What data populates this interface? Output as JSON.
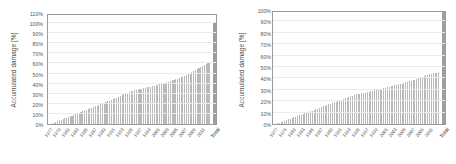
{
  "figure": {
    "background_color": "#ffffff",
    "bar_color": "#b9b9b9",
    "total_bar_color": "#9e9e9e",
    "grid_color": "#ececec",
    "frame_color": "#9a9a9a"
  },
  "charts": [
    {
      "id": "left-chart",
      "ylabel": "Accumulated damage [%]",
      "xlabel": "",
      "yticks": [
        "0%",
        "10%",
        "20%",
        "30%",
        "40%",
        "50%",
        "60%",
        "70%",
        "80%",
        "90%",
        "100%",
        "110%"
      ],
      "total_label": "Total",
      "xticks": [
        "1977",
        "1979",
        "1981",
        "1983",
        "1985",
        "1987",
        "1989",
        "1991",
        "1993",
        "1995",
        "1997",
        "1999",
        "2001",
        "2003",
        "2005",
        "2007",
        "2009",
        "2011"
      ]
    },
    {
      "id": "right-chart",
      "ylabel": "Accumulated damage [%]",
      "xlabel": "",
      "yticks": [
        "0%",
        "10%",
        "20%",
        "30%",
        "40%",
        "50%",
        "60%",
        "70%",
        "80%",
        "90%",
        "100%"
      ],
      "total_label": "Total",
      "xticks": [
        "1977",
        "1979",
        "1981",
        "1983",
        "1985",
        "1987",
        "1989",
        "1991",
        "1993",
        "1995",
        "1997",
        "1999",
        "2001",
        "2003",
        "2005",
        "2007",
        "2009",
        "2011"
      ]
    }
  ],
  "chart_data": [
    {
      "type": "bar",
      "id": "left-chart",
      "title": "",
      "xlabel": "",
      "ylabel": "Accumulated damage [%]",
      "ylim": [
        0,
        110
      ],
      "ytick_values": [
        0,
        10,
        20,
        30,
        40,
        50,
        60,
        70,
        80,
        90,
        100,
        110
      ],
      "ytick_labels": [
        "0%",
        "10%",
        "20%",
        "30%",
        "40%",
        "50%",
        "60%",
        "70%",
        "80%",
        "90%",
        "100%",
        "110%"
      ],
      "grid": true,
      "grid_axis": "y",
      "legend": false,
      "note": "Monotonically increasing cumulative (accumulated damage) bars per time bin, followed by a separated final 'Total' bar at 100%.",
      "categories": [
        "1977",
        "",
        "",
        "",
        "",
        "1979",
        "",
        "",
        "",
        "",
        "1981",
        "",
        "",
        "",
        "",
        "1983",
        "",
        "",
        "",
        "",
        "1985",
        "",
        "",
        "",
        "",
        "1987",
        "",
        "",
        "",
        "",
        "1989",
        "",
        "",
        "",
        "",
        "1991",
        "",
        "",
        "",
        "",
        "1993",
        "",
        "",
        "",
        "",
        "1995",
        "",
        "",
        "",
        "",
        "1997",
        "",
        "",
        "",
        "",
        "1999",
        "",
        "",
        "",
        "",
        "2001",
        "",
        "",
        "",
        "",
        "2003",
        "",
        "",
        "",
        "",
        "2005",
        "",
        "",
        "",
        "",
        "2007",
        "",
        "",
        "",
        "",
        "2009",
        "",
        "",
        "",
        "",
        "2011",
        "",
        "",
        "",
        "Total"
      ],
      "values": [
        0.4,
        0.9,
        1.5,
        2.1,
        2.8,
        3.5,
        4.2,
        4.9,
        5.6,
        6.3,
        7.0,
        7.7,
        8.4,
        9.1,
        9.8,
        10.5,
        11.2,
        11.9,
        12.6,
        13.3,
        14.0,
        14.7,
        15.4,
        16.1,
        16.8,
        17.5,
        18.2,
        18.9,
        19.6,
        20.3,
        21.0,
        21.7,
        22.4,
        23.1,
        23.8,
        24.5,
        25.3,
        26.1,
        26.9,
        27.7,
        28.6,
        29.5,
        30.4,
        31.2,
        31.9,
        32.5,
        33.0,
        33.4,
        33.8,
        34.2,
        34.6,
        35.0,
        35.4,
        35.8,
        36.2,
        36.6,
        37.0,
        37.5,
        38.0,
        38.5,
        39.0,
        39.5,
        40.0,
        40.5,
        41.0,
        41.5,
        42.0,
        42.6,
        43.2,
        43.8,
        44.4,
        45.0,
        45.6,
        46.2,
        46.8,
        47.5,
        48.5,
        49.5,
        50.5,
        51.5,
        52.5,
        53.5,
        54.5,
        55.5,
        56.5,
        57.5,
        58.5,
        59.3,
        60.0,
        60.5,
        100.0
      ]
    },
    {
      "type": "bar",
      "id": "right-chart",
      "title": "",
      "xlabel": "",
      "ylabel": "Accumulated damage [%]",
      "ylim": [
        0,
        100
      ],
      "ytick_values": [
        0,
        10,
        20,
        30,
        40,
        50,
        60,
        70,
        80,
        90,
        100
      ],
      "ytick_labels": [
        "0%",
        "10%",
        "20%",
        "30%",
        "40%",
        "50%",
        "60%",
        "70%",
        "80%",
        "90%",
        "100%"
      ],
      "grid": true,
      "grid_axis": "y",
      "legend": false,
      "note": "Monotonically increasing cumulative (accumulated damage) bars per time bin, followed by a separated final 'Total' bar at 100%.",
      "categories": [
        "1977",
        "",
        "",
        "",
        "",
        "1979",
        "",
        "",
        "",
        "",
        "1981",
        "",
        "",
        "",
        "",
        "1983",
        "",
        "",
        "",
        "",
        "1985",
        "",
        "",
        "",
        "",
        "1987",
        "",
        "",
        "",
        "",
        "1989",
        "",
        "",
        "",
        "",
        "1991",
        "",
        "",
        "",
        "",
        "1993",
        "",
        "",
        "",
        "",
        "1995",
        "",
        "",
        "",
        "",
        "1997",
        "",
        "",
        "",
        "",
        "1999",
        "",
        "",
        "",
        "",
        "2001",
        "",
        "",
        "",
        "",
        "2003",
        "",
        "",
        "",
        "",
        "2005",
        "",
        "",
        "",
        "",
        "2007",
        "",
        "",
        "",
        "",
        "2009",
        "",
        "",
        "",
        "",
        "2011",
        "",
        "",
        "",
        "Total"
      ],
      "values": [
        0.3,
        0.7,
        1.2,
        1.7,
        2.2,
        2.8,
        3.4,
        4.0,
        4.6,
        5.2,
        5.8,
        6.4,
        7.0,
        7.6,
        8.2,
        8.8,
        9.4,
        10.0,
        10.6,
        11.2,
        11.8,
        12.4,
        13.0,
        13.6,
        14.2,
        14.8,
        15.4,
        16.0,
        16.6,
        17.2,
        17.8,
        18.4,
        19.0,
        19.6,
        20.2,
        20.8,
        21.4,
        22.0,
        22.6,
        23.2,
        23.8,
        24.4,
        25.0,
        25.5,
        25.9,
        26.2,
        26.5,
        26.8,
        27.1,
        27.5,
        27.9,
        28.3,
        28.7,
        29.1,
        29.5,
        29.9,
        30.3,
        30.7,
        31.1,
        31.5,
        31.9,
        32.3,
        32.7,
        33.1,
        33.5,
        33.9,
        34.3,
        34.7,
        35.1,
        35.5,
        36.0,
        36.5,
        37.0,
        37.5,
        38.0,
        38.5,
        39.0,
        39.6,
        40.2,
        40.8,
        41.4,
        42.0,
        42.6,
        43.2,
        43.8,
        44.2,
        44.6,
        44.9,
        45.1,
        45.3,
        100.0
      ]
    }
  ]
}
